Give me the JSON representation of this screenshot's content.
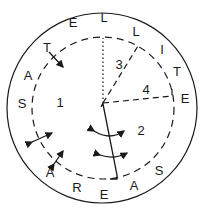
{
  "diagram": {
    "outer_ring_letters": [
      {
        "char": "S",
        "x": 22,
        "y": 108
      },
      {
        "char": "A",
        "x": 28,
        "y": 80
      },
      {
        "char": "T",
        "x": 47,
        "y": 52
      },
      {
        "char": "E",
        "x": 73,
        "y": 27
      },
      {
        "char": "L",
        "x": 104,
        "y": 22
      },
      {
        "char": "L",
        "x": 136,
        "y": 36
      },
      {
        "char": "I",
        "x": 162,
        "y": 54
      },
      {
        "char": "T",
        "x": 177,
        "y": 76
      },
      {
        "char": "E",
        "x": 185,
        "y": 103
      },
      {
        "char": "A",
        "x": 50,
        "y": 177
      },
      {
        "char": "R",
        "x": 77,
        "y": 192
      },
      {
        "char": "E",
        "x": 104,
        "y": 199
      },
      {
        "char": "A",
        "x": 134,
        "y": 190
      },
      {
        "char": "S",
        "x": 159,
        "y": 175
      }
    ],
    "region_numbers": [
      {
        "label": "1",
        "x": 60,
        "y": 107
      },
      {
        "label": "2",
        "x": 141,
        "y": 135
      },
      {
        "label": "3",
        "x": 119,
        "y": 69
      },
      {
        "label": "4",
        "x": 146,
        "y": 94
      }
    ],
    "line_color": "#1a1a1a",
    "background": "#ffffff"
  }
}
